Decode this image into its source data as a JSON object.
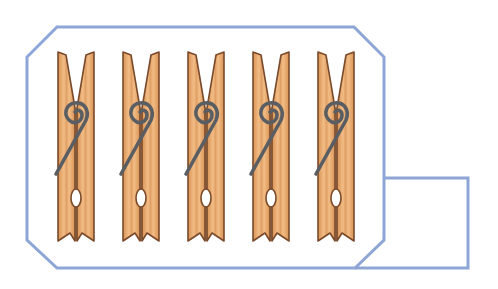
{
  "scene": {
    "description": "Five wooden clothespins inside an outlined container",
    "pin_count": 5,
    "colors": {
      "outline": "#8ea6d6",
      "wood_light": "#f0b981",
      "wood_mid": "#dc9a5c",
      "wood_edge": "#7a4a2a",
      "spring": "#5a5e62",
      "background": "#ffffff"
    },
    "pins": [
      {
        "label": "clothespin 1",
        "x": 58
      },
      {
        "label": "clothespin 2",
        "x": 123
      },
      {
        "label": "clothespin 3",
        "x": 188
      },
      {
        "label": "clothespin 4",
        "x": 253
      },
      {
        "label": "clothespin 5",
        "x": 318
      }
    ]
  }
}
